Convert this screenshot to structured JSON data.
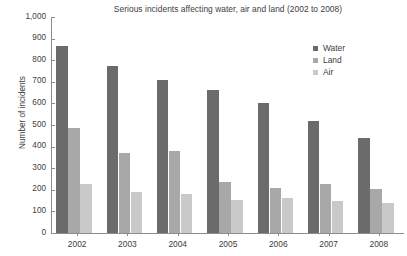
{
  "chart_data": {
    "type": "bar",
    "title": "Serious incidents affecting water, air and land (2002 to 2008)",
    "xlabel": "",
    "ylabel": "Number of incidents",
    "categories": [
      "2002",
      "2003",
      "2004",
      "2005",
      "2006",
      "2007",
      "2008"
    ],
    "series": [
      {
        "name": "Water",
        "color": "#6b6b6b",
        "values": [
          865,
          775,
          710,
          660,
          600,
          520,
          440
        ]
      },
      {
        "name": "Land",
        "color": "#a8a8a8",
        "values": [
          485,
          370,
          380,
          235,
          210,
          225,
          205
        ]
      },
      {
        "name": "Air",
        "color": "#c9c9c9",
        "values": [
          225,
          190,
          180,
          155,
          160,
          150,
          140
        ]
      }
    ],
    "ylim": [
      0,
      1000
    ],
    "yticks": [
      0,
      100,
      200,
      300,
      400,
      500,
      600,
      700,
      800,
      900,
      1000
    ],
    "ytick_labels": [
      "0",
      "100",
      "200",
      "300",
      "400",
      "500",
      "600",
      "700",
      "800",
      "900",
      "1,000"
    ],
    "grid": false,
    "legend_position": "top-right"
  }
}
